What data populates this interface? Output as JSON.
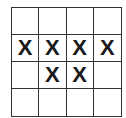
{
  "grid": {
    "rows": 4,
    "cols": 4,
    "cells": [
      [
        "",
        "",
        "",
        ""
      ],
      [
        "X",
        "X",
        "X",
        "X"
      ],
      [
        "",
        "X",
        "X",
        ""
      ],
      [
        "",
        "",
        "",
        ""
      ]
    ]
  }
}
